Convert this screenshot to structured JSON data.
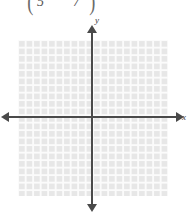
{
  "figure": {
    "width": 190,
    "height": 213,
    "background_color": "#ffffff"
  },
  "matrix_fragment": {
    "description": "cropped matrix row",
    "paren_left": "(",
    "paren_right": ")",
    "entry_1": "5",
    "entry_2": "7"
  },
  "plot": {
    "grid": {
      "visible": true,
      "cell_size_px": 7.5,
      "columns": 20,
      "rows": 21,
      "fill_color": "#e7e7e7",
      "line_color": "#fbfbfb"
    },
    "axes": {
      "color": "#4a4a4a",
      "x_label": "x",
      "y_label": "y",
      "x_arrow_left": "arrow-left",
      "x_arrow_right": "arrow-right",
      "y_arrow_up": "arrow-up",
      "y_arrow_down": "arrow-down",
      "tick_labels_visible": false
    },
    "data_points": []
  },
  "chart_data": {
    "type": "scatter",
    "title": "",
    "xlabel": "x",
    "ylabel": "y",
    "x": [],
    "y": [],
    "xlim": [
      -10,
      10
    ],
    "ylim": [
      -11,
      10
    ],
    "grid": true,
    "legend": null,
    "annotations": [
      "5",
      "7"
    ]
  }
}
